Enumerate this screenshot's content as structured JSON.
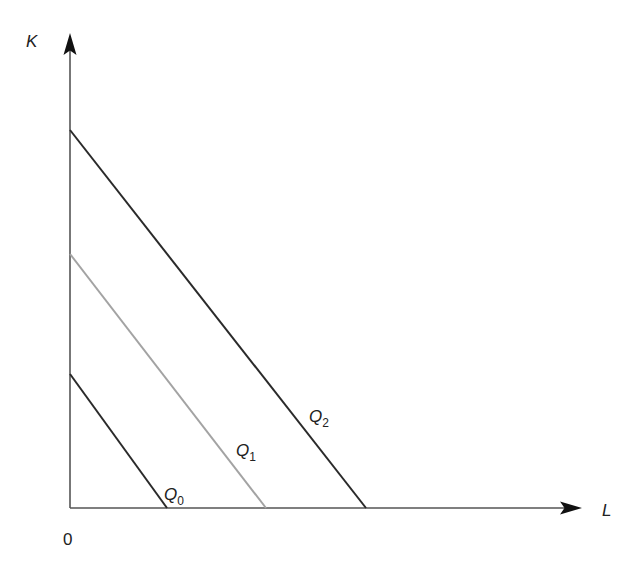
{
  "diagram": {
    "type": "isoquant-map",
    "colors": {
      "axis": "#555555",
      "dark_line": "#2a2a2a",
      "light_line": "#a3a3a3",
      "text": "#222222"
    },
    "axes": {
      "y_label": "K",
      "x_label": "L",
      "origin_label": "0",
      "origin": {
        "x": 70,
        "y": 508
      },
      "y_arrow_tip": {
        "x": 70,
        "y": 33
      },
      "x_arrow_tip": {
        "x": 582,
        "y": 508
      }
    },
    "isoquants": [
      {
        "name": "Q",
        "subscript": "0",
        "color": "#2a2a2a",
        "start": {
          "x": 70,
          "y": 374
        },
        "end": {
          "x": 167,
          "y": 508
        },
        "label_pos": {
          "x": 164,
          "y": 500
        }
      },
      {
        "name": "Q",
        "subscript": "1",
        "color": "#a3a3a3",
        "start": {
          "x": 70,
          "y": 254
        },
        "end": {
          "x": 266,
          "y": 508
        },
        "label_pos": {
          "x": 236,
          "y": 456
        }
      },
      {
        "name": "Q",
        "subscript": "2",
        "color": "#2a2a2a",
        "start": {
          "x": 70,
          "y": 130
        },
        "end": {
          "x": 366,
          "y": 508
        },
        "label_pos": {
          "x": 309,
          "y": 422
        }
      }
    ]
  }
}
